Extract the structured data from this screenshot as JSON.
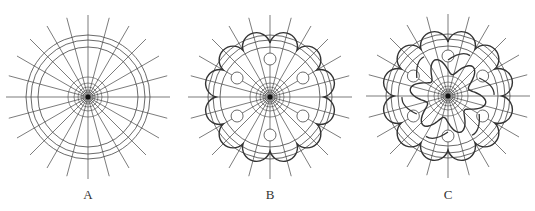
{
  "figure": {
    "panels": [
      {
        "id": "A",
        "label": "A",
        "cx": 88,
        "cy": 97,
        "left": 0,
        "variant": "radial-grid"
      },
      {
        "id": "B",
        "label": "B",
        "cx": 90,
        "cy": 97,
        "left": 180,
        "variant": "scalloped-rosette"
      },
      {
        "id": "C",
        "label": "C",
        "cx": 93,
        "cy": 96,
        "left": 355,
        "variant": "swirl-rosette"
      }
    ],
    "geometry": {
      "spokes": 24,
      "spoke_length": 82,
      "outer_radii": [
        62,
        57,
        50
      ],
      "inner_radii": [
        20,
        14,
        10,
        7,
        5
      ],
      "scallop_count": 12,
      "small_circle_count": 6,
      "stroke_color": "#444444"
    }
  }
}
